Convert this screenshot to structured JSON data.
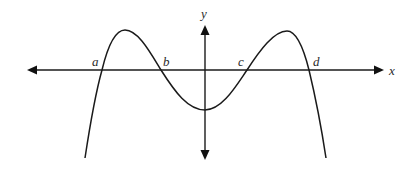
{
  "figure": {
    "axes": {
      "x_label": "x",
      "y_label": "y",
      "x_axis_y_px": 70,
      "y_axis_x_px": 205
    },
    "roots": [
      {
        "label": "a",
        "x_px": 102
      },
      {
        "label": "b",
        "x_px": 161
      },
      {
        "label": "c",
        "x_px": 247
      },
      {
        "label": "d",
        "x_px": 309
      }
    ],
    "curve_features": {
      "left_local_max": "between a and b, above x-axis",
      "local_min": "at y-axis, below x-axis (negative y-intercept)",
      "right_local_max": "between c and d, above x-axis",
      "end_behavior": "both ends go downward"
    },
    "colors": {
      "line": "#1a1a1a",
      "background": "#ffffff"
    }
  }
}
